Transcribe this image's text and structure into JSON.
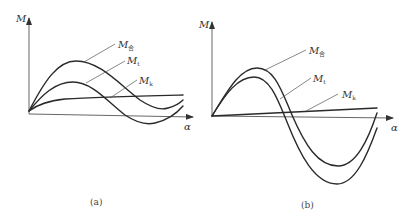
{
  "panels": [
    {
      "id": "a",
      "caption": "(a)",
      "y_axis_label": "M",
      "x_axis_label": "α",
      "curves": [
        {
          "name": "M合",
          "main": "M",
          "sub": "合"
        },
        {
          "name": "Mt",
          "main": "M",
          "sub": "t"
        },
        {
          "name": "Mk",
          "main": "M",
          "sub": "k"
        }
      ]
    },
    {
      "id": "b",
      "caption": "(b)",
      "y_axis_label": "M",
      "x_axis_label": "α",
      "curves": [
        {
          "name": "M合",
          "main": "M",
          "sub": "合"
        },
        {
          "name": "Mt",
          "main": "M",
          "sub": "t"
        },
        {
          "name": "Mk",
          "main": "M",
          "sub": "k"
        }
      ]
    }
  ],
  "colors": {
    "line": "#2a2a2a",
    "axis": "#555555",
    "background": "#ffffff"
  }
}
